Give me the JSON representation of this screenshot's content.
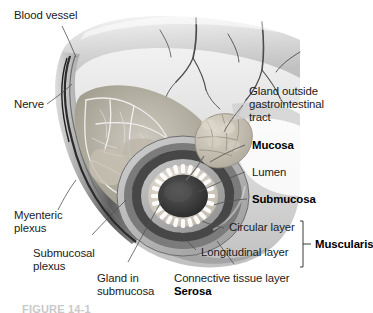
{
  "figure": {
    "caption": "FIGURE 14-1",
    "background_color": "#ffffff",
    "text_color": "#1b1b1b"
  },
  "labels": {
    "blood_vessel": "Blood vessel",
    "nerve": "Nerve",
    "gland_outside_line1": "Gland outside",
    "gland_outside_line2": "gastrointestinal",
    "gland_outside_line3": "tract",
    "mucosa": "Mucosa",
    "lumen": "Lumen",
    "submucosa": "Submucosa",
    "circular_layer": "Circular layer",
    "longitudinal_layer": "Longitudinal layer",
    "muscularis": "Muscularis",
    "myenteric_line1": "Myenteric",
    "myenteric_line2": "plexus",
    "submucosal_line1": "Submucosal",
    "submucosal_line2": "plexus",
    "gland_in_line1": "Gland in",
    "gland_in_line2": "submucosa",
    "connective_tissue_layer": "Connective tissue layer",
    "serosa": "Serosa"
  },
  "label_styles": {
    "bold_labels": [
      "Mucosa",
      "Submucosa",
      "Muscularis",
      "Serosa"
    ],
    "regular_labels": [
      "Blood vessel",
      "Nerve",
      "Gland outside gastrointestinal tract",
      "Lumen",
      "Circular layer",
      "Longitudinal layer",
      "Myenteric plexus",
      "Submucosal plexus",
      "Gland in submucosa",
      "Connective tissue layer"
    ]
  },
  "anatomy": {
    "structure": "tubular gastrointestinal segment cut open to expose concentric wall layers",
    "layers_outer_to_inner": [
      "Serosa (connective tissue layer)",
      "Longitudinal muscle layer",
      "Circular muscle layer",
      "Submucosa",
      "Mucosa",
      "Lumen"
    ],
    "colors": {
      "serosa": "#b9b9b9",
      "longitudinal_muscle": "#6e6e6e",
      "circular_muscle": "#4a4a4a",
      "submucosa": "#a8a8a8",
      "mucosa": "#d8d2c8",
      "lumen": "#3a3a3a",
      "gland": "#c8c2b6",
      "vessel_dark": "#2e2e2e",
      "outer_surface": "#d2d2d2",
      "leader_line": "#5a5a5a"
    }
  }
}
